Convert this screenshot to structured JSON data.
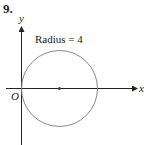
{
  "problem": {
    "number": "9."
  },
  "axes": {
    "x_label": "x",
    "y_label": "y",
    "origin_label": "O"
  },
  "annotation": "Radius = 4",
  "circle": {
    "radius": 4,
    "center": [
      4,
      0
    ],
    "passes_through_origin": true
  },
  "colors": {
    "axis": "#222222",
    "circle": "#888888"
  }
}
